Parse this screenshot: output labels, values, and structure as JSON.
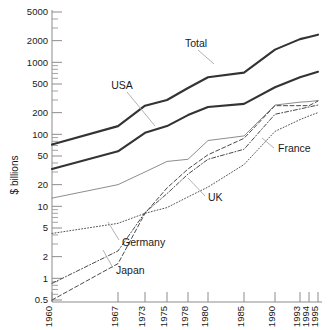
{
  "chart_data": {
    "type": "line",
    "title": "",
    "subtitle": "",
    "xlabel": "",
    "ylabel": "$ billions",
    "yscale": "log",
    "ylim": [
      0.5,
      5000
    ],
    "xlim": [
      1960,
      1995
    ],
    "grid": false,
    "legend_position": "inline-annotations",
    "y_ticks": [
      0.5,
      1,
      2,
      5,
      10,
      20,
      50,
      100,
      200,
      500,
      1000,
      2000,
      5000
    ],
    "y_tick_labels": [
      "0.5",
      "1",
      "2",
      "5",
      "10",
      "20",
      "50",
      "100",
      "200",
      "500",
      "1000",
      "2000",
      "5000"
    ],
    "x_ticks": [
      1960,
      1967,
      1973,
      1975,
      1978,
      1980,
      1985,
      1990,
      1993,
      1994,
      1995
    ],
    "x_tick_labels": [
      "1960",
      "1967",
      "1973",
      "1975",
      "1978",
      "1980",
      "1985",
      "1990",
      "1993",
      "1994",
      "1995"
    ],
    "series": [
      {
        "name": "Total",
        "style": "solid-thick",
        "color": "#333333",
        "x": [
          1960,
          1967,
          1973,
          1975,
          1978,
          1980,
          1985,
          1990,
          1993,
          1994,
          1995
        ],
        "values": [
          72,
          130,
          250,
          300,
          440,
          620,
          720,
          1500,
          2100,
          2250,
          2420
        ]
      },
      {
        "name": "USA",
        "style": "solid-thick",
        "color": "#333333",
        "x": [
          1960,
          1967,
          1973,
          1975,
          1978,
          1980,
          1985,
          1990,
          1993,
          1994,
          1995
        ],
        "values": [
          33,
          58,
          105,
          130,
          185,
          240,
          265,
          450,
          620,
          680,
          740
        ]
      },
      {
        "name": "France",
        "style": "solid-thin",
        "color": "#808080",
        "x": [
          1960,
          1967,
          1973,
          1975,
          1978,
          1980,
          1985,
          1990,
          1993,
          1994,
          1995
        ],
        "values": [
          13,
          20,
          30,
          42,
          45,
          82,
          95,
          255,
          280,
          285,
          295
        ]
      },
      {
        "name": "UK",
        "style": "dotted",
        "color": "#555555",
        "x": [
          1960,
          1967,
          1973,
          1975,
          1978,
          1980,
          1985,
          1990,
          1993,
          1994,
          1995
        ],
        "values": [
          4.2,
          5.8,
          8.0,
          9.6,
          13.5,
          18.5,
          38,
          110,
          160,
          180,
          200
        ]
      },
      {
        "name": "Germany",
        "style": "dash-dot",
        "color": "#4a4a4a",
        "x": [
          1960,
          1967,
          1973,
          1975,
          1978,
          1980,
          1985,
          1990,
          1993,
          1994,
          1995
        ],
        "values": [
          0.85,
          2.4,
          8.2,
          15,
          28,
          45,
          62,
          190,
          225,
          240,
          255
        ]
      },
      {
        "name": "Japan",
        "style": "dashed",
        "color": "#4a4a4a",
        "x": [
          1960,
          1967,
          1973,
          1975,
          1978,
          1980,
          1985,
          1990,
          1993,
          1994,
          1995
        ],
        "values": [
          0.5,
          1.6,
          8.0,
          18,
          33,
          52,
          88,
          250,
          250,
          250,
          290
        ]
      }
    ],
    "annotations": [
      {
        "label": "Total",
        "x": 1979.0,
        "y": 1050
      },
      {
        "label": "USA",
        "x": 1972.5,
        "y": 480
      },
      {
        "label": "France",
        "x": 1991.0,
        "y": 40
      },
      {
        "label": "UK",
        "x": 1985.5,
        "y": 11
      },
      {
        "label": "Germany",
        "x": 1976.0,
        "y": 2.3
      },
      {
        "label": "Japan",
        "x": 1974.5,
        "y": 1.0
      }
    ]
  },
  "axis": {
    "y_title": "$ billions"
  }
}
